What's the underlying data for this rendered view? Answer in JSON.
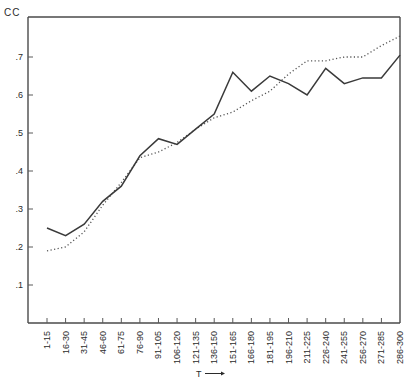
{
  "chart_data": {
    "type": "line",
    "title": "",
    "xlabel": "T",
    "ylabel": "CC",
    "ylim": [
      0,
      0.8
    ],
    "yticks": [
      ".1",
      ".2",
      ".3",
      ".4",
      ".5",
      ".6",
      ".7"
    ],
    "ytick_values": [
      0.1,
      0.2,
      0.3,
      0.4,
      0.5,
      0.6,
      0.7
    ],
    "grid": false,
    "legend": null,
    "categories": [
      "1-15",
      "16-30",
      "31-45",
      "46-60",
      "61-75",
      "76-90",
      "91-105",
      "106-120",
      "121-135",
      "136-150",
      "151-165",
      "166-180",
      "181-195",
      "196-210",
      "211-225",
      "226-240",
      "241-255",
      "256-270",
      "271-285",
      "286-300"
    ],
    "series": [
      {
        "name": "solid",
        "style": "solid",
        "color": "#3a3a3a",
        "values": [
          0.25,
          0.23,
          0.26,
          0.32,
          0.36,
          0.44,
          0.485,
          0.47,
          0.51,
          0.55,
          0.66,
          0.61,
          0.65,
          0.63,
          0.6,
          0.67,
          0.63,
          0.645,
          0.645,
          0.705
        ]
      },
      {
        "name": "dotted",
        "style": "dotted",
        "color": "#555555",
        "values": [
          0.19,
          0.2,
          0.24,
          0.31,
          0.37,
          0.435,
          0.45,
          0.475,
          0.51,
          0.54,
          0.555,
          0.585,
          0.61,
          0.655,
          0.69,
          0.69,
          0.7,
          0.7,
          0.73,
          0.755
        ]
      }
    ]
  },
  "labels": {
    "y_title": "CC",
    "x_title": "T",
    "x_arrow": "⟶"
  }
}
